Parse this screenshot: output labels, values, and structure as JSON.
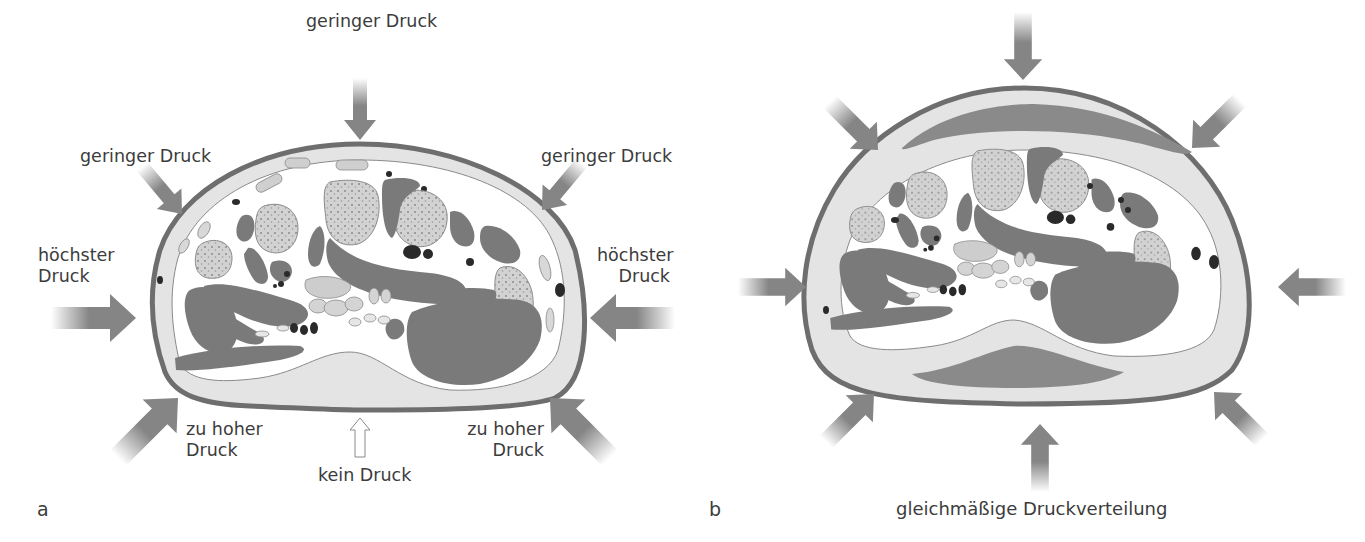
{
  "figure": {
    "panel_a": {
      "letter": "a",
      "labels": {
        "top": "geringer Druck",
        "upper_left": "geringer Druck",
        "upper_right": "geringer Druck",
        "left_line1": "höchster",
        "left_line2": "Druck",
        "right_line1": "höchster",
        "right_line2": "Druck",
        "lower_left_line1": "zu hoher",
        "lower_left_line2": "Druck",
        "lower_right_line1": "zu hoher",
        "lower_right_line2": "Druck",
        "bottom": "kein Druck"
      }
    },
    "panel_b": {
      "letter": "b",
      "caption": "gleichmäßige Druckverteilung"
    },
    "colors": {
      "skin_outline": "#6e6e6e",
      "fat_layer": "#e4e4e4",
      "muscle": "#7a7a7a",
      "bone": "#cfcfcf",
      "vessel": "#2a2a2a",
      "arrow": "#858585",
      "pad": "#8a8a8a"
    }
  }
}
